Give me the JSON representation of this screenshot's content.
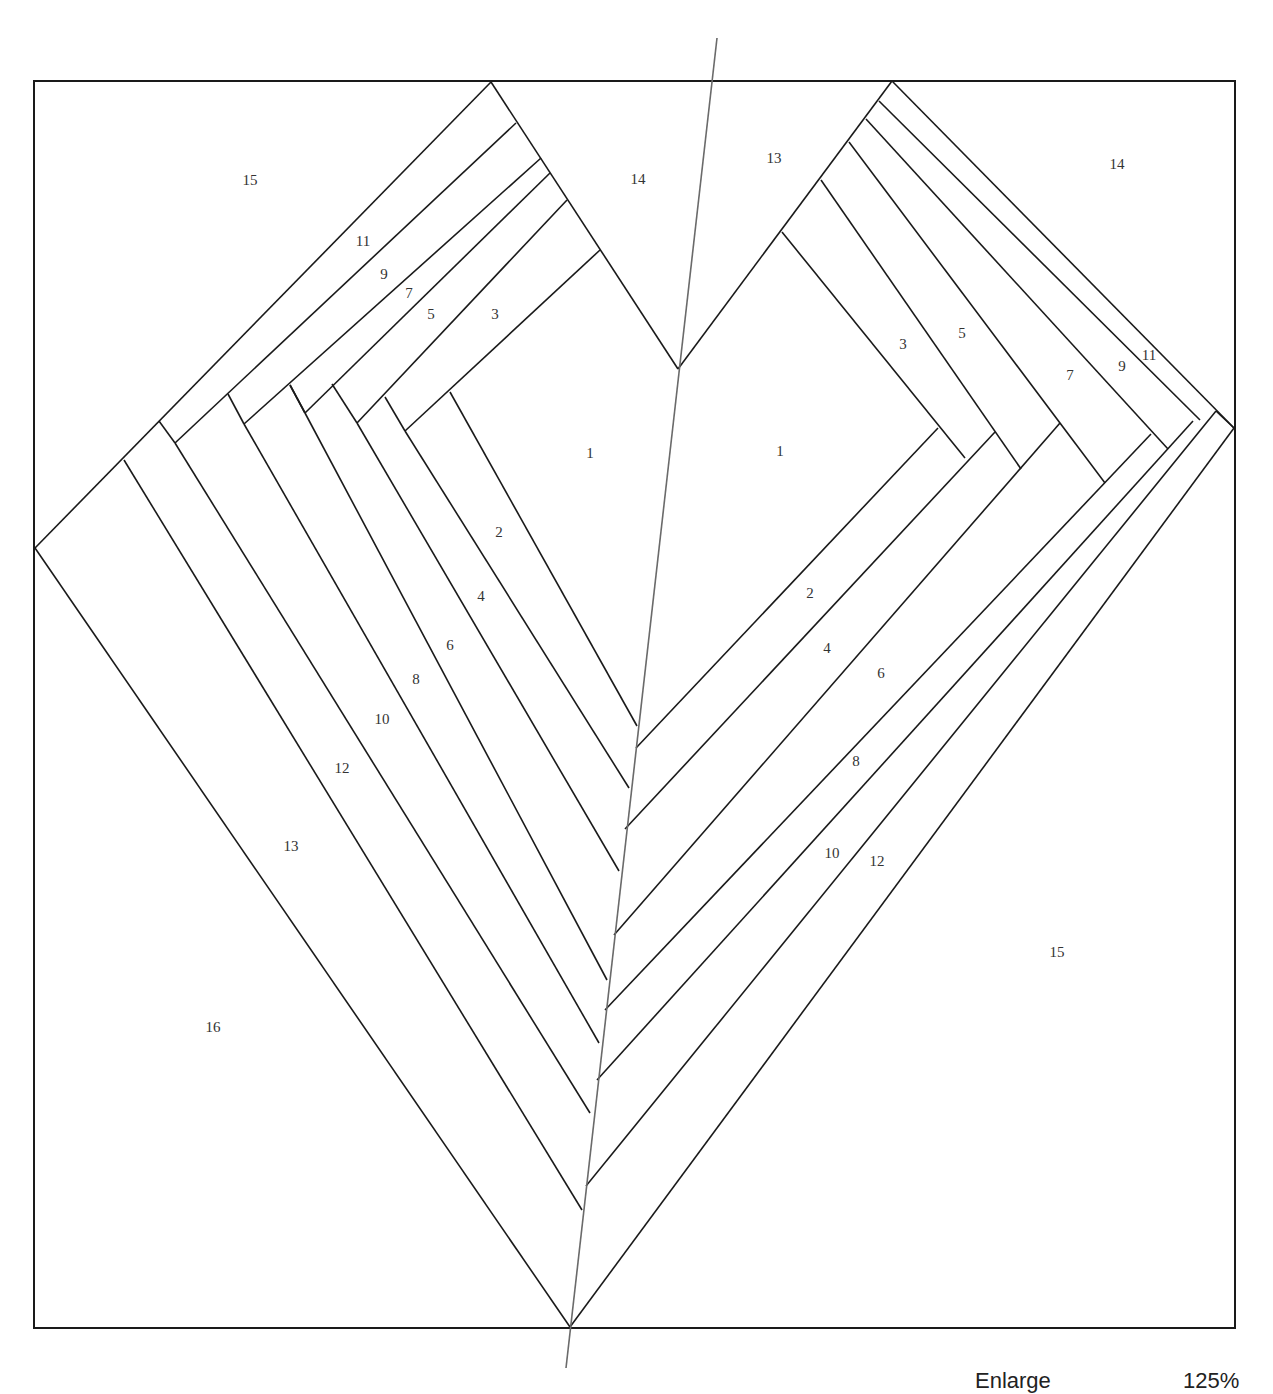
{
  "diagram": {
    "frame": {
      "x1": 33,
      "y1": 81,
      "x2": 1235,
      "y2": 1328
    },
    "centerline": {
      "x1": 717,
      "y1": 38,
      "x2": 566,
      "y2": 1368,
      "color": "#6a6a6a"
    },
    "line_color": "#1a1a1a",
    "left_labels": [
      {
        "text": "15",
        "x": 250,
        "y": 182
      },
      {
        "text": "14",
        "x": 638,
        "y": 181
      },
      {
        "text": "11",
        "x": 363,
        "y": 243
      },
      {
        "text": "9",
        "x": 384,
        "y": 276
      },
      {
        "text": "7",
        "x": 409,
        "y": 295
      },
      {
        "text": "5",
        "x": 431,
        "y": 316
      },
      {
        "text": "3",
        "x": 495,
        "y": 316
      },
      {
        "text": "1",
        "x": 590,
        "y": 455
      },
      {
        "text": "2",
        "x": 499,
        "y": 534
      },
      {
        "text": "4",
        "x": 481,
        "y": 598
      },
      {
        "text": "6",
        "x": 450,
        "y": 647
      },
      {
        "text": "8",
        "x": 416,
        "y": 681
      },
      {
        "text": "10",
        "x": 382,
        "y": 721
      },
      {
        "text": "12",
        "x": 342,
        "y": 770
      },
      {
        "text": "13",
        "x": 291,
        "y": 848
      },
      {
        "text": "16",
        "x": 213,
        "y": 1029
      }
    ],
    "right_labels": [
      {
        "text": "13",
        "x": 774,
        "y": 160
      },
      {
        "text": "14",
        "x": 1117,
        "y": 166
      },
      {
        "text": "3",
        "x": 903,
        "y": 346
      },
      {
        "text": "5",
        "x": 962,
        "y": 335
      },
      {
        "text": "7",
        "x": 1070,
        "y": 377
      },
      {
        "text": "9",
        "x": 1122,
        "y": 368
      },
      {
        "text": "11",
        "x": 1147,
        "y": 358
      },
      {
        "text": "1",
        "x": 780,
        "y": 453
      },
      {
        "text": "2",
        "x": 810,
        "y": 595
      },
      {
        "text": "4",
        "x": 827,
        "y": 650
      },
      {
        "text": "6",
        "x": 881,
        "y": 675
      },
      {
        "text": "8",
        "x": 856,
        "y": 763
      },
      {
        "text": "10",
        "x": 832,
        "y": 855
      },
      {
        "text": "12",
        "x": 877,
        "y": 863
      },
      {
        "text": "15",
        "x": 1057,
        "y": 954
      }
    ]
  },
  "footer": {
    "instruction": "Enlarge",
    "percentage": "125%"
  }
}
